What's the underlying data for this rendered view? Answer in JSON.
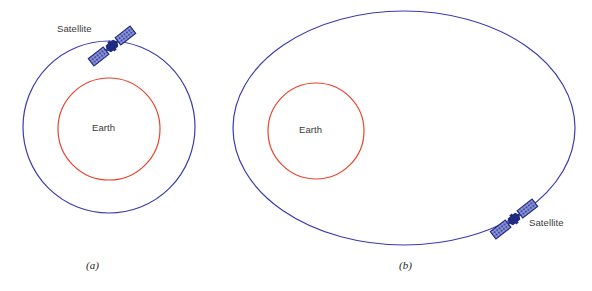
{
  "figure": {
    "title": "",
    "background": "#ffffff",
    "colors": {
      "orbit": "#3b3bb0",
      "earth": "#e8432a",
      "satellite_body": "#1f2a80",
      "satellite_panel_fill": "#8f97d6",
      "satellite_panel_stroke": "#1f2a80",
      "label_text": "#3a3a3a",
      "caption_text": "#231f20"
    }
  },
  "panels": [
    {
      "id": "panel-a",
      "caption": "(a)",
      "orbit_shape": "circle",
      "orbit": {
        "cx": 109,
        "cy": 127,
        "rx": 87,
        "ry": 83
      },
      "earth": {
        "label": "Earth",
        "cx": 109,
        "cy": 129,
        "r": 51
      },
      "satellite": {
        "label": "Satellite",
        "x": 112,
        "y": 46,
        "rotation_deg": -35
      }
    },
    {
      "id": "panel-b",
      "caption": "(b)",
      "orbit_shape": "ellipse",
      "orbit": {
        "cx": 404,
        "cy": 128,
        "rx": 172,
        "ry": 118
      },
      "earth": {
        "label": "Earth",
        "cx": 316,
        "cy": 131,
        "r": 48
      },
      "satellite": {
        "label": "Satellite",
        "x": 514,
        "y": 219,
        "rotation_deg": -35
      }
    }
  ],
  "labels": {
    "earth": "Earth",
    "satellite": "Satellite",
    "caption_a": "(a)",
    "caption_b": "(b)"
  }
}
